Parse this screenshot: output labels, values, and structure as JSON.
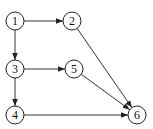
{
  "diagram": {
    "type": "directed-graph",
    "nodes": [
      {
        "id": "1",
        "label": "1",
        "x": 15,
        "y": 21
      },
      {
        "id": "2",
        "label": "2",
        "x": 72,
        "y": 21
      },
      {
        "id": "3",
        "label": "3",
        "x": 15,
        "y": 69
      },
      {
        "id": "5",
        "label": "5",
        "x": 74,
        "y": 69
      },
      {
        "id": "4",
        "label": "4",
        "x": 15,
        "y": 115
      },
      {
        "id": "6",
        "label": "6",
        "x": 137,
        "y": 115
      }
    ],
    "edges": [
      {
        "from": "1",
        "to": "2"
      },
      {
        "from": "1",
        "to": "3"
      },
      {
        "from": "3",
        "to": "5"
      },
      {
        "from": "3",
        "to": "4"
      },
      {
        "from": "2",
        "to": "6"
      },
      {
        "from": "5",
        "to": "6"
      },
      {
        "from": "4",
        "to": "6"
      }
    ]
  }
}
